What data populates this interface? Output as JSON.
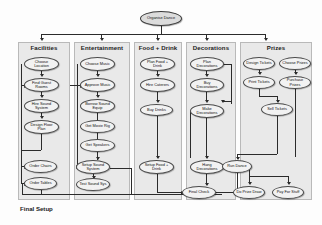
{
  "diagram": {
    "root": {
      "label": "Organise Dance",
      "x": 140,
      "y": 11,
      "w": 42,
      "h": 15
    },
    "lanes": [
      {
        "id": "facilities",
        "title": "Facilities",
        "x": 18,
        "y": 42,
        "w": 52,
        "h": 158,
        "title_x": 18,
        "title_y": 44
      },
      {
        "id": "entertainment",
        "title": "Entertainment",
        "x": 74,
        "y": 42,
        "w": 56,
        "h": 158,
        "title_x": 74,
        "title_y": 44
      },
      {
        "id": "food",
        "title": "Food + Drink",
        "x": 134,
        "y": 42,
        "w": 48,
        "h": 158,
        "title_x": 134,
        "title_y": 44
      },
      {
        "id": "decorations",
        "title": "Decorations",
        "x": 186,
        "y": 42,
        "w": 50,
        "h": 158,
        "title_x": 186,
        "title_y": 44
      },
      {
        "id": "prizes",
        "title": "Prizes",
        "x": 240,
        "y": 42,
        "w": 72,
        "h": 158,
        "title_x": 240,
        "title_y": 44
      }
    ],
    "footer": {
      "label": "Final Setup",
      "x": 20,
      "y": 205
    },
    "nodes": [
      {
        "id": "choose-location",
        "label": "Choose Location",
        "x": 24,
        "y": 57,
        "w": 35,
        "h": 14,
        "lane": "facilities"
      },
      {
        "id": "find-guest-rooms",
        "label": "Find Guest Rooms",
        "x": 24,
        "y": 78,
        "w": 35,
        "h": 14,
        "lane": "facilities"
      },
      {
        "id": "hire-sound-system",
        "label": "Hire Sound System",
        "x": 24,
        "y": 99,
        "w": 35,
        "h": 14,
        "lane": "facilities"
      },
      {
        "id": "design-floor-plan",
        "label": "Design Floor Plan",
        "x": 24,
        "y": 120,
        "w": 35,
        "h": 14,
        "lane": "facilities"
      },
      {
        "id": "order-chairs",
        "label": "Order Chairs",
        "x": 24,
        "y": 160,
        "w": 33,
        "h": 13,
        "lane": "facilities"
      },
      {
        "id": "order-tables",
        "label": "Order Tables",
        "x": 24,
        "y": 177,
        "w": 33,
        "h": 13,
        "lane": "facilities"
      },
      {
        "id": "choose-music",
        "label": "Choose Music",
        "x": 80,
        "y": 57,
        "w": 35,
        "h": 14,
        "lane": "entertainment"
      },
      {
        "id": "approve-music",
        "label": "Approve Music",
        "x": 80,
        "y": 78,
        "w": 35,
        "h": 14,
        "lane": "entertainment"
      },
      {
        "id": "borrow-sound",
        "label": "Borrow Sound Equip",
        "x": 80,
        "y": 99,
        "w": 35,
        "h": 14,
        "lane": "entertainment"
      },
      {
        "id": "get-movie-rig",
        "label": "Get Movie Rig",
        "x": 80,
        "y": 120,
        "w": 35,
        "h": 13,
        "lane": "entertainment"
      },
      {
        "id": "get-speakers",
        "label": "Get Speakers",
        "x": 80,
        "y": 139,
        "w": 35,
        "h": 13,
        "lane": "entertainment"
      },
      {
        "id": "setup-sound",
        "label": "Setup Sound System",
        "x": 76,
        "y": 160,
        "w": 34,
        "h": 14,
        "lane": "entertainment"
      },
      {
        "id": "test-sound",
        "label": "Test Sound Sys",
        "x": 76,
        "y": 178,
        "w": 34,
        "h": 13,
        "lane": "entertainment"
      },
      {
        "id": "plan-food",
        "label": "Plan Food + Drink",
        "x": 140,
        "y": 57,
        "w": 35,
        "h": 14,
        "lane": "food"
      },
      {
        "id": "hire-caterers",
        "label": "Hire Caterers",
        "x": 140,
        "y": 78,
        "w": 35,
        "h": 14,
        "lane": "food"
      },
      {
        "id": "buy-drinks",
        "label": "Buy Drinks",
        "x": 140,
        "y": 104,
        "w": 33,
        "h": 12,
        "lane": "food"
      },
      {
        "id": "setup-food",
        "label": "Setup Food + Drink",
        "x": 139,
        "y": 160,
        "w": 35,
        "h": 14,
        "lane": "food"
      },
      {
        "id": "plan-decorations",
        "label": "Plan Decorations",
        "x": 190,
        "y": 57,
        "w": 34,
        "h": 14,
        "lane": "decorations"
      },
      {
        "id": "buy-decorations",
        "label": "Buy Decorations",
        "x": 190,
        "y": 78,
        "w": 34,
        "h": 14,
        "lane": "decorations"
      },
      {
        "id": "make-decorations",
        "label": "Make Decorations",
        "x": 190,
        "y": 104,
        "w": 34,
        "h": 14,
        "lane": "decorations"
      },
      {
        "id": "hang-decorations",
        "label": "Hang Decorations",
        "x": 190,
        "y": 160,
        "w": 34,
        "h": 14,
        "lane": "decorations"
      },
      {
        "id": "design-tickets",
        "label": "Design Tickets",
        "x": 243,
        "y": 57,
        "w": 32,
        "h": 13,
        "lane": "prizes"
      },
      {
        "id": "choose-prizes",
        "label": "Choose Prizes",
        "x": 279,
        "y": 57,
        "w": 32,
        "h": 13,
        "lane": "prizes"
      },
      {
        "id": "print-tickets",
        "label": "Print Tickets",
        "x": 243,
        "y": 76,
        "w": 32,
        "h": 13,
        "lane": "prizes"
      },
      {
        "id": "purchase-prizes",
        "label": "Purchase Prizes",
        "x": 279,
        "y": 76,
        "w": 32,
        "h": 13,
        "lane": "prizes"
      },
      {
        "id": "sell-tickets",
        "label": "Sell Tickets",
        "x": 261,
        "y": 103,
        "w": 32,
        "h": 13,
        "lane": "prizes"
      },
      {
        "id": "final-check",
        "label": "Final Check",
        "x": 182,
        "y": 186,
        "w": 34,
        "h": 13,
        "lane": "none"
      },
      {
        "id": "run-dance",
        "label": "Run Dance",
        "x": 222,
        "y": 160,
        "w": 30,
        "h": 13,
        "lane": "none"
      },
      {
        "id": "do-prize-draw",
        "label": "Do Prize Draw",
        "x": 233,
        "y": 186,
        "w": 32,
        "h": 13,
        "lane": "none"
      },
      {
        "id": "pay-for-stuff",
        "label": "Pay For Stuff",
        "x": 272,
        "y": 186,
        "w": 32,
        "h": 13,
        "lane": "none"
      }
    ]
  }
}
